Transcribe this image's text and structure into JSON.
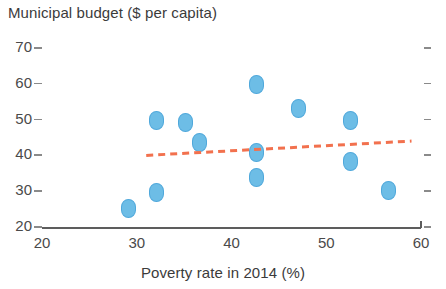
{
  "chart_data": {
    "type": "scatter",
    "title": "",
    "xlabel": "Poverty rate in 2014 (%)",
    "ylabel": "Municipal budget ($ per capita)",
    "xlim": [
      20,
      60
    ],
    "ylim": [
      20,
      70
    ],
    "xticks": [
      20,
      30,
      40,
      50,
      60
    ],
    "yticks": [
      20,
      30,
      40,
      50,
      60,
      70
    ],
    "xtick_labels": [
      "20",
      "30",
      "40",
      "50",
      "60"
    ],
    "ytick_labels": [
      "20",
      "30",
      "40",
      "50",
      "60",
      "70"
    ],
    "grid": false,
    "legend": null,
    "marker": "diamond",
    "marker_color": "#6dbde6",
    "points": [
      {
        "x": 29.0,
        "y": 25.5
      },
      {
        "x": 32.0,
        "y": 50.0
      },
      {
        "x": 32.0,
        "y": 30.0
      },
      {
        "x": 35.0,
        "y": 49.5
      },
      {
        "x": 36.5,
        "y": 44.0
      },
      {
        "x": 42.5,
        "y": 60.0
      },
      {
        "x": 42.5,
        "y": 41.0
      },
      {
        "x": 42.5,
        "y": 34.0
      },
      {
        "x": 47.0,
        "y": 53.5
      },
      {
        "x": 52.5,
        "y": 50.0
      },
      {
        "x": 52.5,
        "y": 38.5
      },
      {
        "x": 56.5,
        "y": 30.5
      }
    ],
    "trendline": {
      "style": "dashed",
      "color": "#f2714e",
      "x_start": 31.0,
      "y_start": 40.0,
      "x_end": 59.0,
      "y_end": 44.0
    }
  }
}
